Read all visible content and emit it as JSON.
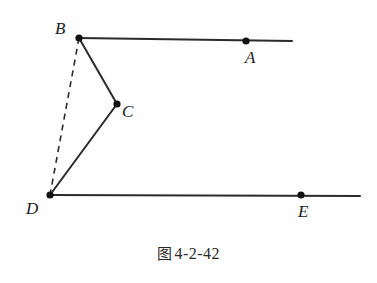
{
  "figure": {
    "caption_prefix": "图",
    "caption_number": "4-2-42",
    "caption_full": "图 4-2-42",
    "background_color": "#fefefe",
    "stroke_color": "#2b2b2b",
    "point_color": "#111111",
    "width": 377,
    "height": 283
  },
  "points": [
    {
      "id": "B",
      "label": "B",
      "x": 79,
      "y": 38,
      "label_x": 55,
      "label_y": 20
    },
    {
      "id": "A",
      "label": "A",
      "x": 246,
      "y": 41,
      "label_x": 245,
      "label_y": 49
    },
    {
      "id": "C",
      "label": "C",
      "x": 117,
      "y": 104,
      "label_x": 122,
      "label_y": 103
    },
    {
      "id": "D",
      "label": "D",
      "x": 50,
      "y": 195,
      "label_x": 26,
      "label_y": 200
    },
    {
      "id": "E",
      "label": "E",
      "x": 301,
      "y": 195,
      "label_x": 298,
      "label_y": 203
    }
  ],
  "segments": [
    {
      "id": "ray-BA",
      "from": "B",
      "to": "A",
      "style": "solid",
      "x1": 79,
      "y1": 38,
      "x2": 292,
      "y2": 41,
      "note": "horizontal ray through A extending right of B"
    },
    {
      "id": "ray-DE",
      "from": "D",
      "to": "E",
      "style": "solid",
      "x1": 50,
      "y1": 195,
      "x2": 360,
      "y2": 196,
      "note": "horizontal ray through E extending right of D"
    },
    {
      "id": "segment-BC",
      "from": "B",
      "to": "C",
      "style": "solid",
      "x1": 79,
      "y1": 38,
      "x2": 117,
      "y2": 104
    },
    {
      "id": "segment-CD",
      "from": "C",
      "to": "D",
      "style": "solid",
      "x1": 117,
      "y1": 104,
      "x2": 50,
      "y2": 195
    },
    {
      "id": "segment-BD",
      "from": "B",
      "to": "D",
      "style": "dashed",
      "x1": 79,
      "y1": 38,
      "x2": 50,
      "y2": 195,
      "note": "auxiliary construction line"
    }
  ]
}
